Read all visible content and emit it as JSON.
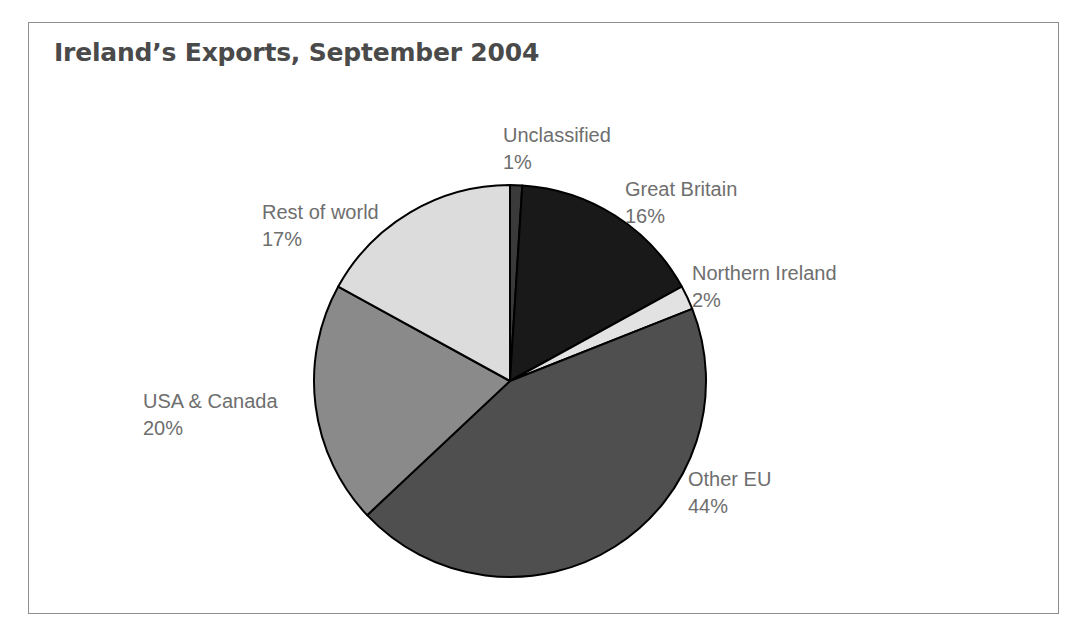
{
  "chart_data": {
    "type": "pie",
    "title": "Ireland’s Exports, September 2004",
    "xlabel": "",
    "ylabel": "",
    "legend_position": "none",
    "grid": false,
    "units": "percent",
    "start_angle_deg": 0,
    "direction": "clockwise",
    "categories": [
      "Unclassified",
      "Great Britain",
      "Northern Ireland",
      "Other EU",
      "USA & Canada",
      "Rest of world"
    ],
    "values": [
      1,
      16,
      2,
      44,
      20,
      17
    ],
    "slices": [
      {
        "name": "Unclassified",
        "value": 1,
        "value_label": "1%",
        "color": "#3a3a3a",
        "label_id": "label-unclassified"
      },
      {
        "name": "Great Britain",
        "value": 16,
        "value_label": "16%",
        "color": "#191919",
        "label_id": "label-great-britain"
      },
      {
        "name": "Northern Ireland",
        "value": 2,
        "value_label": "2%",
        "color": "#e2e2e2",
        "label_id": "label-northern-ireland"
      },
      {
        "name": "Other EU",
        "value": 44,
        "value_label": "44%",
        "color": "#4f4f4f",
        "label_id": "label-other-eu"
      },
      {
        "name": "USA & Canada",
        "value": 20,
        "value_label": "20%",
        "color": "#8a8a8a",
        "label_id": "label-usa-canada"
      },
      {
        "name": "Rest of world",
        "value": 17,
        "value_label": "17%",
        "color": "#dcdcdc",
        "label_id": "label-rest-of-world"
      }
    ]
  },
  "figure": {
    "title": "Ireland’s Exports, September 2004",
    "frame_color": "#8d8d8d",
    "background": "#ffffff",
    "title_color": "#4a4a4a",
    "label_color": "#6e6e6e",
    "slice_outline_color": "#000000"
  },
  "labels": {
    "unclassified": {
      "name": "Unclassified",
      "pct": "1%"
    },
    "great_britain": {
      "name": "Great Britain",
      "pct": "16%"
    },
    "northern_ireland": {
      "name": "Northern Ireland",
      "pct": "2%"
    },
    "other_eu": {
      "name": "Other EU",
      "pct": "44%"
    },
    "usa_canada": {
      "name": "USA & Canada",
      "pct": "20%"
    },
    "rest_of_world": {
      "name": "Rest of world",
      "pct": "17%"
    }
  }
}
